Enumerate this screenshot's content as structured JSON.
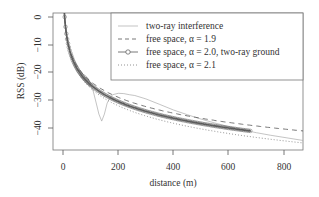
{
  "chart_data": {
    "type": "line",
    "title": "",
    "xlabel": "distance (m)",
    "ylabel": "RSS (dB)",
    "xlim": [
      -30,
      870
    ],
    "ylim": [
      -47,
      1.5
    ],
    "xticks": [
      0,
      200,
      400,
      600,
      800
    ],
    "yticks": [
      0,
      -10,
      -20,
      -30,
      -40
    ],
    "grid": false,
    "legend_position": "top-right",
    "reference_distance_m": 6,
    "series": [
      {
        "name": "two-ray interference",
        "style": "solid-thin",
        "color": "#aaaaaa",
        "x": [
          3,
          10,
          20,
          30,
          40,
          50,
          60,
          70,
          80,
          90,
          100,
          110,
          120,
          130,
          140,
          150,
          160,
          170,
          180,
          200,
          220,
          240,
          260,
          300,
          350,
          400,
          450,
          500,
          550,
          600,
          650,
          700,
          750,
          800,
          870
        ],
        "values": [
          2,
          -4,
          -10,
          -14,
          -16.5,
          -18.5,
          -20,
          -20.5,
          -21,
          -22,
          -24,
          -27,
          -31,
          -35,
          -37.5,
          -35,
          -31,
          -29,
          -28,
          -27.5,
          -27.6,
          -28,
          -28.3,
          -29.5,
          -31.5,
          -33.5,
          -35.2,
          -36.8,
          -38.2,
          -39.5,
          -40.7,
          -41.7,
          -42.6,
          -43.4,
          -44.5
        ]
      },
      {
        "name": "free space, α = 1.9",
        "style": "dashed",
        "color": "#555555",
        "alpha": 1.9,
        "x_range": [
          3,
          870
        ]
      },
      {
        "name": "free space, α = 2.0, two-ray ground",
        "style": "solid-circle-markers",
        "color": "#555555",
        "alpha": 2.0,
        "x_range": [
          3,
          680
        ]
      },
      {
        "name": "free space, α = 2.1",
        "style": "dotted",
        "color": "#777777",
        "alpha": 2.1,
        "x_range": [
          3,
          870
        ]
      }
    ]
  },
  "legend": {
    "items": [
      {
        "label": "two-ray interference"
      },
      {
        "label": "free space, α = 1.9"
      },
      {
        "label": "free space, α = 2.0, two-ray ground"
      },
      {
        "label": "free space, α = 2.1"
      }
    ]
  },
  "axes": {
    "x_tick_labels": [
      "0",
      "200",
      "400",
      "600",
      "800"
    ],
    "y_tick_labels": [
      "0",
      "−10",
      "−20",
      "−30",
      "−40"
    ],
    "xlabel": "distance (m)",
    "ylabel": "RSS (dB)"
  }
}
